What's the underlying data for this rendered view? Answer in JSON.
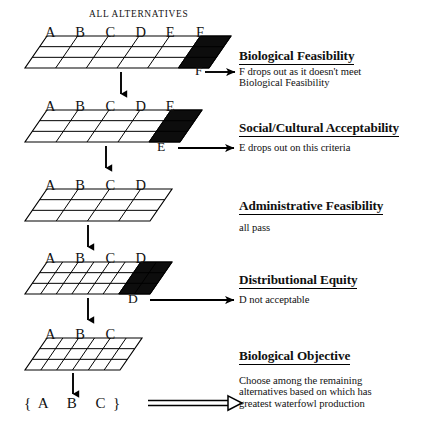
{
  "figure": {
    "title": "ALL ALTERNATIVES",
    "final_set": "{  A     B     C  }"
  },
  "stages": [
    {
      "id": "biological-feasibility",
      "heading": "Biological Feasibility",
      "note": "F drops out as it doesn't meet\nBiological Feasibility",
      "letters": [
        "A",
        "B",
        "C",
        "D",
        "E",
        "F"
      ],
      "dropped_letter": "F",
      "columns": 6,
      "rows": 3,
      "black_columns": 1,
      "fine": false
    },
    {
      "id": "social-cultural-acceptability",
      "heading": "Social/Cultural Acceptability",
      "note": "E drops out on this criteria",
      "letters": [
        "A",
        "B",
        "C",
        "D",
        "E"
      ],
      "dropped_letter": "E",
      "columns": 5,
      "rows": 3,
      "black_columns": 1,
      "fine": false
    },
    {
      "id": "administrative-feasibility",
      "heading": "Administrative Feasibility",
      "note": "all pass",
      "letters": [
        "A",
        "B",
        "C",
        "D"
      ],
      "dropped_letter": "",
      "columns": 4,
      "rows": 3,
      "black_columns": 0,
      "fine": false
    },
    {
      "id": "distributional-equity",
      "heading": "Distributional Equity",
      "note": "D not acceptable",
      "letters": [
        "A",
        "B",
        "C",
        "D"
      ],
      "dropped_letter": "D",
      "columns": 8,
      "rows": 3,
      "black_columns": 2,
      "fine": true
    },
    {
      "id": "biological-objective",
      "heading": "Biological Objective",
      "note": "Choose among the remaining\nalternatives based on which has\ngreatest waterfowl production",
      "letters": [
        "A",
        "B",
        "C"
      ],
      "dropped_letter": "",
      "columns": 6,
      "rows": 3,
      "black_columns": 0,
      "fine": true
    }
  ],
  "colors": {
    "ink": "#000000",
    "paper": "#ffffff",
    "fill_black": "#0d0d0d"
  }
}
